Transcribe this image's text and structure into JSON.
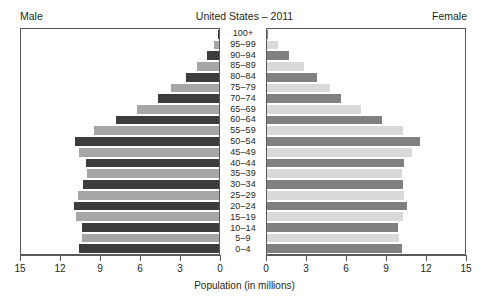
{
  "header": {
    "left_label": "Male",
    "right_label": "Female",
    "title": "United States – 2011"
  },
  "axis": {
    "caption": "Population (in millions)",
    "ticks": [
      15,
      12,
      9,
      6,
      3,
      0
    ],
    "ticks_female": [
      0,
      3,
      6,
      9,
      12,
      15
    ],
    "max": 15
  },
  "colors": {
    "male_dark": "#3c3c3c",
    "male_light": "#a6a6a6",
    "female_dark": "#808080",
    "female_light": "#d9d9d9",
    "frame": "#58595b",
    "text": "#231f20",
    "background": "#ffffff"
  },
  "chart_data": {
    "type": "bar",
    "title": "United States – 2011",
    "xlabel": "Population (in millions)",
    "ylabel": "",
    "xlim": [
      0,
      15
    ],
    "grid": false,
    "legend": [
      "Male",
      "Female"
    ],
    "orientation": "horizontal-pyramid",
    "categories": [
      "100+",
      "95–99",
      "90–94",
      "85–89",
      "80–84",
      "75–79",
      "70–74",
      "65–69",
      "60–64",
      "55–59",
      "50–54",
      "45–49",
      "40–44",
      "35–39",
      "30–34",
      "25–29",
      "20–24",
      "15–19",
      "10–14",
      "5–9",
      "0–4"
    ],
    "series": [
      {
        "name": "Male",
        "values": [
          0.05,
          0.4,
          0.9,
          1.7,
          2.5,
          3.6,
          4.6,
          6.2,
          7.8,
          9.5,
          10.9,
          10.6,
          10.1,
          10.0,
          10.3,
          10.7,
          11.0,
          10.8,
          10.4,
          10.4,
          10.6
        ]
      },
      {
        "name": "Female",
        "values": [
          0.1,
          0.8,
          1.7,
          2.8,
          3.8,
          4.8,
          5.6,
          7.1,
          8.7,
          10.3,
          11.6,
          11.0,
          10.4,
          10.2,
          10.3,
          10.4,
          10.6,
          10.3,
          9.9,
          10.0,
          10.2
        ]
      }
    ]
  }
}
